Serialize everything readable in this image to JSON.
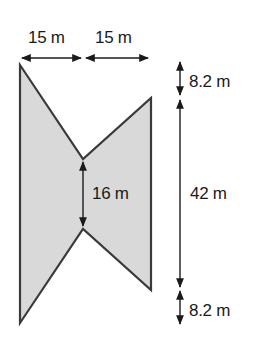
{
  "diagram": {
    "type": "composite-shape-dimensions",
    "shape_fill": "#d9d9d9",
    "stroke_color": "#3a3a3a",
    "labels": {
      "top_left_width": "15 m",
      "top_right_width": "15 m",
      "top_offset": "8.2 m",
      "total_height": "42 m",
      "notch_gap": "16 m",
      "bottom_offset": "8.2 m"
    }
  }
}
